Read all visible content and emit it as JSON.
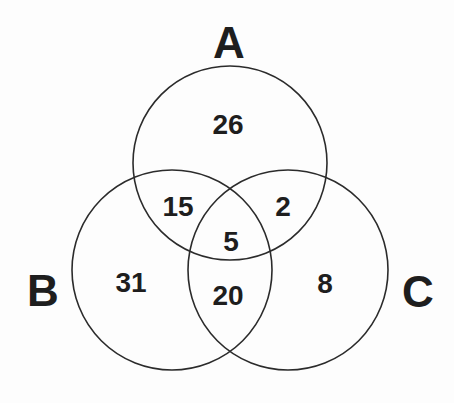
{
  "diagram": {
    "type": "venn",
    "sets": [
      {
        "id": "A",
        "label": "A"
      },
      {
        "id": "B",
        "label": "B"
      },
      {
        "id": "C",
        "label": "C"
      }
    ],
    "regions": {
      "A_only": "26",
      "A_and_B_only": "15",
      "A_and_C_only": "2",
      "A_and_B_and_C": "5",
      "B_only": "31",
      "B_and_C_only": "20",
      "C_only": "8"
    },
    "colors": {
      "stroke": "#2b2b2b",
      "text": "#1e1e1e",
      "background": "#fdfdfd"
    }
  }
}
